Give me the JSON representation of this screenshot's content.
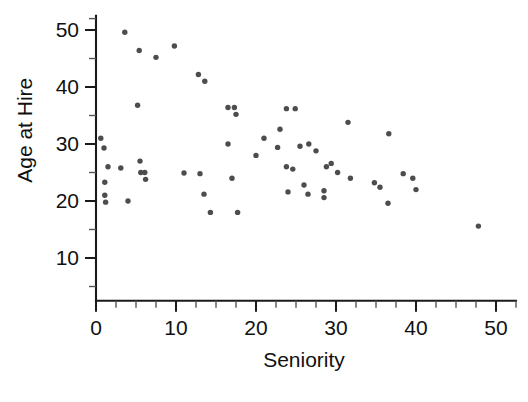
{
  "chart_data": {
    "type": "scatter",
    "title": "",
    "xlabel": "Seniority",
    "ylabel": "Age at Hire",
    "xlim": [
      0,
      52.5
    ],
    "ylim": [
      2.5,
      52.5
    ],
    "grid": false,
    "legend": null,
    "xticks": [
      0,
      10,
      20,
      30,
      40,
      50
    ],
    "xtick_labels": [
      "0",
      "10",
      "20",
      "30",
      "40",
      "50"
    ],
    "x_minor_step": 2.5,
    "yticks": [
      10,
      20,
      30,
      40,
      50
    ],
    "ytick_labels": [
      "10",
      "20",
      "30",
      "40",
      "50"
    ],
    "y_minor_step": 5,
    "marker": "circle",
    "marker_color": "#4d4d4d",
    "marker_size": 5,
    "n_points": 58,
    "points": [
      {
        "x": 0.6,
        "y": 31.0
      },
      {
        "x": 1.0,
        "y": 29.3
      },
      {
        "x": 1.1,
        "y": 23.3
      },
      {
        "x": 1.1,
        "y": 21.0
      },
      {
        "x": 1.2,
        "y": 19.8
      },
      {
        "x": 1.5,
        "y": 26.0
      },
      {
        "x": 3.1,
        "y": 25.8
      },
      {
        "x": 3.6,
        "y": 49.6
      },
      {
        "x": 4.0,
        "y": 20.0
      },
      {
        "x": 5.4,
        "y": 46.4
      },
      {
        "x": 5.5,
        "y": 27.0
      },
      {
        "x": 5.6,
        "y": 25.0
      },
      {
        "x": 6.1,
        "y": 25.0
      },
      {
        "x": 6.2,
        "y": 23.8
      },
      {
        "x": 5.2,
        "y": 36.8
      },
      {
        "x": 7.5,
        "y": 45.2
      },
      {
        "x": 9.8,
        "y": 47.2
      },
      {
        "x": 12.8,
        "y": 42.2
      },
      {
        "x": 13.6,
        "y": 41.0
      },
      {
        "x": 13.0,
        "y": 24.8
      },
      {
        "x": 13.5,
        "y": 21.2
      },
      {
        "x": 14.3,
        "y": 18.0
      },
      {
        "x": 16.5,
        "y": 36.4
      },
      {
        "x": 17.3,
        "y": 36.4
      },
      {
        "x": 17.5,
        "y": 35.2
      },
      {
        "x": 16.5,
        "y": 30.0
      },
      {
        "x": 17.0,
        "y": 24.0
      },
      {
        "x": 17.7,
        "y": 18.0
      },
      {
        "x": 20.0,
        "y": 28.0
      },
      {
        "x": 23.0,
        "y": 32.6
      },
      {
        "x": 23.8,
        "y": 36.2
      },
      {
        "x": 24.9,
        "y": 36.2
      },
      {
        "x": 22.7,
        "y": 29.4
      },
      {
        "x": 23.8,
        "y": 26.0
      },
      {
        "x": 24.6,
        "y": 25.6
      },
      {
        "x": 24.0,
        "y": 21.6
      },
      {
        "x": 25.5,
        "y": 29.6
      },
      {
        "x": 26.0,
        "y": 22.8
      },
      {
        "x": 26.6,
        "y": 30.0
      },
      {
        "x": 27.5,
        "y": 28.8
      },
      {
        "x": 28.8,
        "y": 26.0
      },
      {
        "x": 26.5,
        "y": 21.2
      },
      {
        "x": 28.5,
        "y": 21.8
      },
      {
        "x": 28.5,
        "y": 20.6
      },
      {
        "x": 29.4,
        "y": 26.6
      },
      {
        "x": 31.5,
        "y": 33.8
      },
      {
        "x": 31.8,
        "y": 24.0
      },
      {
        "x": 34.8,
        "y": 23.2
      },
      {
        "x": 35.5,
        "y": 22.4
      },
      {
        "x": 36.6,
        "y": 31.8
      },
      {
        "x": 36.5,
        "y": 19.6
      },
      {
        "x": 38.4,
        "y": 24.8
      },
      {
        "x": 39.6,
        "y": 24.0
      },
      {
        "x": 40.0,
        "y": 22.0
      },
      {
        "x": 47.8,
        "y": 15.6
      },
      {
        "x": 11.0,
        "y": 24.9
      },
      {
        "x": 21.0,
        "y": 31.0
      },
      {
        "x": 30.2,
        "y": 25.0
      }
    ]
  },
  "axes": {
    "y_title": "Age at Hire",
    "x_title": "Seniority"
  }
}
